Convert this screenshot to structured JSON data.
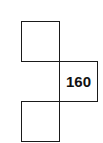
{
  "diagram": {
    "cells": [
      {
        "position": "top-left",
        "value": ""
      },
      {
        "position": "middle-right",
        "value": "160"
      },
      {
        "position": "bottom-left",
        "value": ""
      }
    ]
  }
}
